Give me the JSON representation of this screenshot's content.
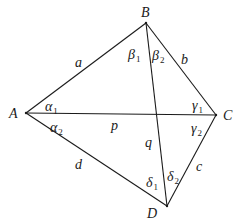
{
  "diagram": {
    "type": "quadrilateral-with-diagonals",
    "vertices": [
      {
        "name": "A",
        "x": 26,
        "y": 113,
        "lx": 9,
        "ly": 118
      },
      {
        "name": "B",
        "x": 146,
        "y": 23,
        "lx": 141,
        "ly": 17
      },
      {
        "name": "C",
        "x": 216,
        "y": 115,
        "lx": 223,
        "ly": 120
      },
      {
        "name": "D",
        "x": 167,
        "y": 206,
        "lx": 147,
        "ly": 218
      }
    ],
    "sides": [
      {
        "name": "a",
        "from": "A",
        "to": "B",
        "lx": 75,
        "ly": 67
      },
      {
        "name": "b",
        "from": "B",
        "to": "C",
        "lx": 181,
        "ly": 64
      },
      {
        "name": "c",
        "from": "C",
        "to": "D",
        "lx": 196,
        "ly": 171
      },
      {
        "name": "d",
        "from": "A",
        "to": "D",
        "lx": 75,
        "ly": 169
      }
    ],
    "diagonals": [
      {
        "name": "p",
        "from": "A",
        "to": "C",
        "lx": 111,
        "ly": 130
      },
      {
        "name": "q",
        "from": "B",
        "to": "D",
        "lx": 145,
        "ly": 147
      }
    ],
    "angles": [
      {
        "symbol": "α",
        "sub": "1",
        "lx": 45,
        "ly": 111
      },
      {
        "symbol": "α",
        "sub": "2",
        "lx": 50,
        "ly": 132
      },
      {
        "symbol": "β",
        "sub": "1",
        "lx": 128,
        "ly": 59
      },
      {
        "symbol": "β",
        "sub": "2",
        "lx": 152,
        "ly": 60
      },
      {
        "symbol": "γ",
        "sub": "1",
        "lx": 192,
        "ly": 110
      },
      {
        "symbol": "γ",
        "sub": "2",
        "lx": 191,
        "ly": 133
      },
      {
        "symbol": "δ",
        "sub": "1",
        "lx": 146,
        "ly": 187
      },
      {
        "symbol": "δ",
        "sub": "2",
        "lx": 167,
        "ly": 181
      }
    ],
    "stroke_color": "#1a1a1a",
    "background": "#ffffff"
  }
}
